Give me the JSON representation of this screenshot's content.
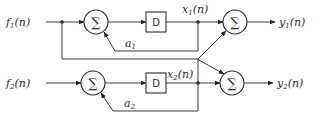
{
  "diagram": {
    "type": "block-diagram",
    "inputs": [
      {
        "name": "f",
        "sub": "1",
        "suffix": "(n)"
      },
      {
        "name": "f",
        "sub": "2",
        "suffix": "(n)"
      }
    ],
    "outputs": [
      {
        "name": "y",
        "sub": "1",
        "suffix": "(n)"
      },
      {
        "name": "y",
        "sub": "2",
        "suffix": "(n)"
      }
    ],
    "states": [
      {
        "name": "x",
        "sub": "1",
        "suffix": "(n)"
      },
      {
        "name": "x",
        "sub": "2",
        "suffix": "(n)"
      }
    ],
    "delays": [
      {
        "label": "D"
      },
      {
        "label": "D"
      }
    ],
    "summers": [
      {
        "symbol": "∑"
      },
      {
        "symbol": "∑"
      },
      {
        "symbol": "∑"
      },
      {
        "symbol": "∑"
      }
    ],
    "gains": [
      {
        "name": "a",
        "sub": "1"
      },
      {
        "name": "a",
        "sub": "2"
      }
    ],
    "colors": {
      "line": "#3a3a3a",
      "background": "#ffffff"
    }
  }
}
